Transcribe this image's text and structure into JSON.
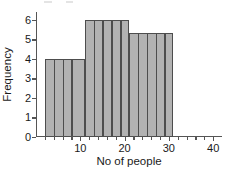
{
  "chart_data": {
    "type": "bar",
    "title": "",
    "subtitle": "",
    "xlabel": "No of people",
    "ylabel": "Frequency",
    "xlim": [
      0,
      42
    ],
    "ylim": [
      0,
      6.4
    ],
    "grid": false,
    "legend": null,
    "x_ticks_major": [
      10,
      20,
      30,
      40
    ],
    "x_tick_labels": [
      "10",
      "20",
      "30",
      "40"
    ],
    "x_ticks_minor": [
      2,
      4,
      6,
      8,
      12,
      14,
      16,
      18,
      22,
      24,
      26,
      28,
      32,
      34,
      36,
      38
    ],
    "y_ticks": [
      0,
      1,
      2,
      3,
      4,
      5,
      6
    ],
    "y_tick_labels": [
      "0",
      "1",
      "2",
      "3",
      "4",
      "5",
      "6"
    ],
    "bin_edges": [
      2,
      11,
      21,
      31
    ],
    "bars": [
      {
        "x_start": 2,
        "x_end": 11,
        "value": 4.0,
        "label": "4"
      },
      {
        "x_start": 11,
        "x_end": 21,
        "value": 6.0,
        "label": "6"
      },
      {
        "x_start": 21,
        "x_end": 31,
        "value": 5.35,
        "label": "5.35"
      }
    ],
    "internal_dividers": [
      4,
      6,
      8,
      13,
      15,
      17,
      19,
      23,
      25,
      27,
      29
    ],
    "colors": {
      "bar_fill": "#b2b2b2",
      "bar_edge": "#4d4d4d",
      "axis": "#555555",
      "text": "#1a1a1a",
      "background": "#ffffff"
    }
  }
}
